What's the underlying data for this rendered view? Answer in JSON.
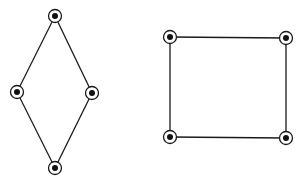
{
  "canvas": {
    "width": 302,
    "height": 188,
    "background": "#ffffff"
  },
  "style": {
    "stroke": "#1a1a1a",
    "dot_fill": "#111111",
    "ring_radius": 6.5,
    "dot_radius": 3
  },
  "graphs": [
    {
      "name": "diamond-graph",
      "nodes": [
        {
          "id": "top",
          "x": 55,
          "y": 16
        },
        {
          "id": "left",
          "x": 17,
          "y": 92
        },
        {
          "id": "right",
          "x": 92,
          "y": 93
        },
        {
          "id": "bottom",
          "x": 55,
          "y": 168
        }
      ],
      "edges": [
        [
          "top",
          "left"
        ],
        [
          "top",
          "right"
        ],
        [
          "left",
          "bottom"
        ],
        [
          "right",
          "bottom"
        ]
      ]
    },
    {
      "name": "square-graph",
      "nodes": [
        {
          "id": "top-left",
          "x": 170,
          "y": 37
        },
        {
          "id": "top-right",
          "x": 286,
          "y": 38
        },
        {
          "id": "bottom-left",
          "x": 170,
          "y": 137
        },
        {
          "id": "bottom-right",
          "x": 286,
          "y": 138
        }
      ],
      "edges": [
        [
          "top-left",
          "top-right"
        ],
        [
          "top-right",
          "bottom-right"
        ],
        [
          "bottom-right",
          "bottom-left"
        ],
        [
          "bottom-left",
          "top-left"
        ]
      ]
    }
  ]
}
